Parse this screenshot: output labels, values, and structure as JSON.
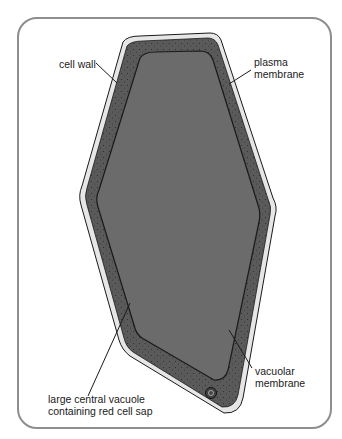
{
  "diagram": {
    "labels": {
      "cell_wall": "cell wall",
      "plasma_membrane_line1": "plasma",
      "plasma_membrane_line2": "membrane",
      "vacuolar_membrane_line1": "vacuolar",
      "vacuolar_membrane_line2": "membrane",
      "vacuole_line1": "large central vacuole",
      "vacuole_line2": "containing red cell sap"
    },
    "colors": {
      "frame": "#8e8e8e",
      "cell_wall": "#e6e6e6",
      "cytoplasm": "#5a5a5a",
      "vacuole": "#6b6b6b",
      "outline": "#1a1a1a"
    }
  }
}
